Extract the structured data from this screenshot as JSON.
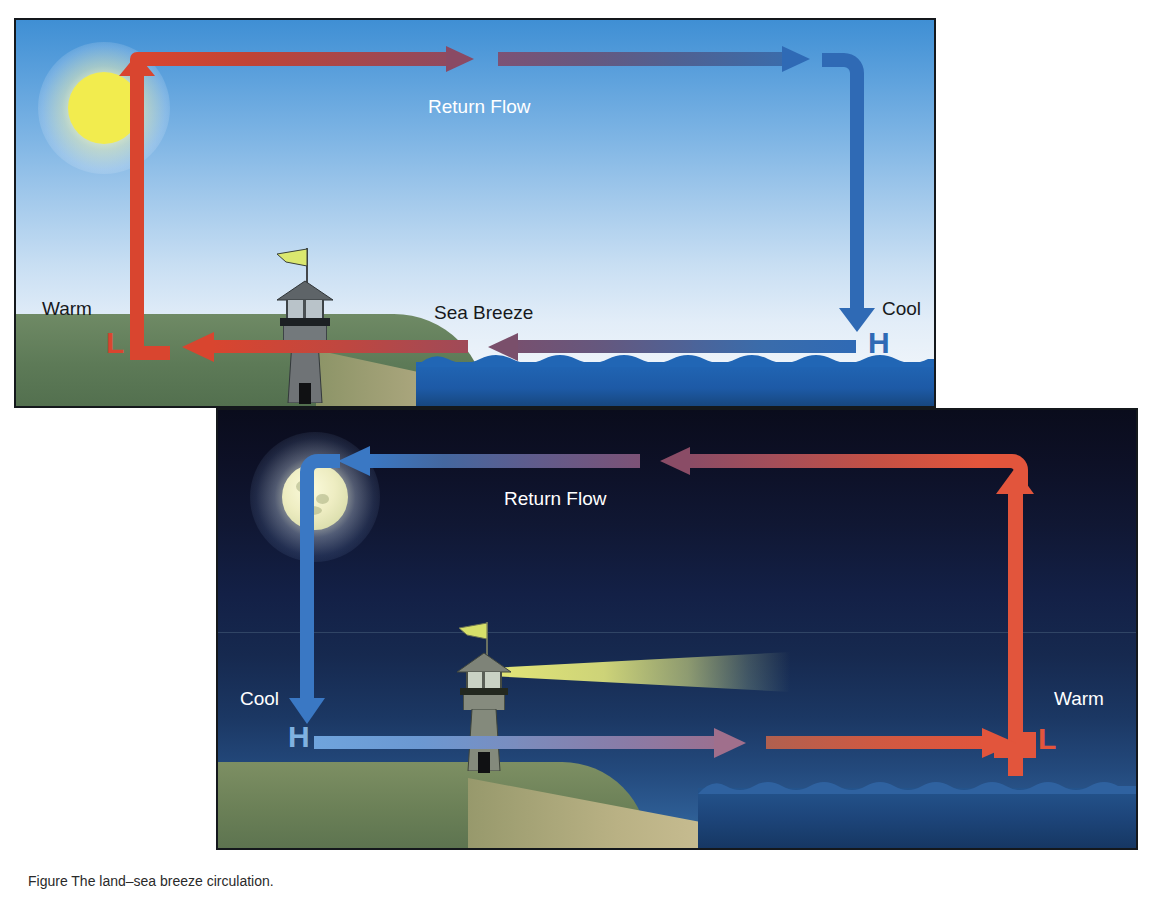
{
  "figure": {
    "caption": "Figure  The land–sea breeze circulation."
  },
  "day_panel": {
    "name": "Daytime sea breeze circulation",
    "labels": {
      "return_flow": "Return Flow",
      "surface_flow": "Sea Breeze",
      "left_temp": "Warm",
      "right_temp": "Cool",
      "left_pressure": "L",
      "right_pressure": "H"
    },
    "scene": {
      "sun": "sun",
      "lighthouse": "lighthouse",
      "land": "land",
      "beach": "beach",
      "ocean": "ocean"
    }
  },
  "night_panel": {
    "name": "Nighttime land breeze circulation",
    "labels": {
      "return_flow": "Return Flow",
      "left_temp": "Cool",
      "right_temp": "Warm",
      "left_pressure": "H",
      "right_pressure": "L"
    },
    "scene": {
      "moon": "moon",
      "lighthouse": "lighthouse",
      "beacon": "light beam",
      "land": "land",
      "beach": "beach",
      "ocean": "ocean"
    }
  },
  "colors": {
    "warm_arrow": "#d9452f",
    "cool_arrow": "#2f6ab5",
    "mixed_arrow": "#7a5f84",
    "sun": "#f2ec4e",
    "moon": "#f2f0c8",
    "day_sky_top": "#3f8fd4",
    "day_sky_bottom": "#f2f6fb",
    "night_sky_top": "#0a0c1c",
    "night_sky_bottom": "#39709f",
    "land_green": "#5d7a57",
    "beach_tan": "#c0b490",
    "ocean_blue": "#2166b5",
    "lighthouse_gray": "#6f7376",
    "flag_yellow": "#d9e36a",
    "beam_yellow": "#eceE78"
  }
}
